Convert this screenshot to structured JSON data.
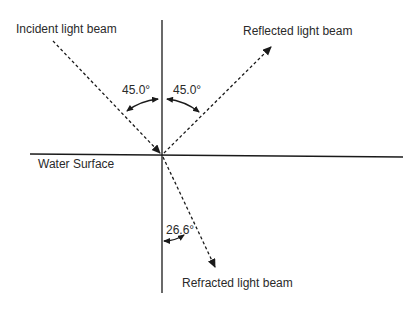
{
  "labels": {
    "incident": "Incident light beam",
    "reflected": "Reflected light beam",
    "refracted": "Refracted light beam",
    "surface": "Water Surface",
    "angle_incident": "45.0°",
    "angle_reflected": "45.0°",
    "angle_refracted": "26.6°"
  },
  "angles": {
    "incidence_deg": 45.0,
    "reflection_deg": 45.0,
    "refraction_deg": 26.6
  },
  "colors": {
    "line": "#1a1a1a",
    "text": "#2a2a2a",
    "background": "#ffffff"
  }
}
